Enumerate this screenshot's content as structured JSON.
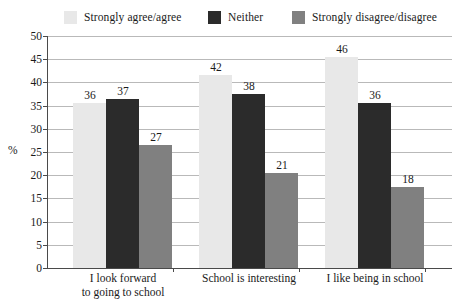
{
  "chart_data": {
    "type": "bar",
    "title": "",
    "xlabel": "",
    "ylabel": "%",
    "ylim": [
      0,
      50
    ],
    "ytick_step": 5,
    "yticks": [
      50,
      45,
      40,
      35,
      30,
      25,
      20,
      15,
      10,
      5,
      0
    ],
    "grid": true,
    "legend_position": "top",
    "categories": [
      "I look forward\nto going to school",
      "School is interesting",
      "I like being in school"
    ],
    "categories_lines": [
      [
        "I look forward",
        "to going to school"
      ],
      [
        "School is interesting"
      ],
      [
        "I like being in school"
      ]
    ],
    "series": [
      {
        "name": "Strongly agree/agree",
        "color": "#e8e8e8",
        "values": [
          36,
          42,
          46
        ]
      },
      {
        "name": "Neither",
        "color": "#2b2b2b",
        "values": [
          37,
          38,
          36
        ]
      },
      {
        "name": "Strongly disagree/disagree",
        "color": "#808080",
        "values": [
          27,
          21,
          18
        ]
      }
    ]
  },
  "colors": {
    "series_light": "#e8e8e8",
    "series_dark": "#2b2b2b",
    "series_gray": "#808080",
    "gridline": "#b9b9b9",
    "axis": "#4a4a4a",
    "text": "#1a1a1a",
    "background": "#ffffff"
  }
}
